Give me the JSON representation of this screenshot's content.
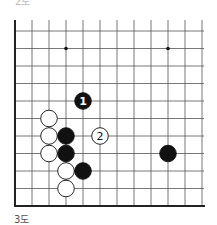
{
  "diagram": {
    "caption": "3도",
    "top_cut_caption": "2도",
    "board": {
      "columns": 12,
      "rows": 11,
      "origin_x": 15,
      "spacing_x": 17,
      "first_row_y": 31,
      "spacing_y": 17.5,
      "left_edge": true,
      "bottom_edge": true,
      "line_color": "#555555",
      "edge_color": "#222222",
      "star_points": [
        {
          "col": 3,
          "row": 1
        },
        {
          "col": 9,
          "row": 1
        }
      ]
    },
    "stones": [
      {
        "color": "black",
        "col": 4,
        "row": 4,
        "label": "1"
      },
      {
        "color": "white",
        "col": 2,
        "row": 5,
        "label": ""
      },
      {
        "color": "white",
        "col": 2,
        "row": 6,
        "label": ""
      },
      {
        "color": "black",
        "col": 3,
        "row": 6,
        "label": ""
      },
      {
        "color": "white",
        "col": 5,
        "row": 6,
        "label": "2"
      },
      {
        "color": "white",
        "col": 2,
        "row": 7,
        "label": ""
      },
      {
        "color": "black",
        "col": 3,
        "row": 7,
        "label": ""
      },
      {
        "color": "black",
        "col": 9,
        "row": 7,
        "label": ""
      },
      {
        "color": "white",
        "col": 3,
        "row": 8,
        "label": ""
      },
      {
        "color": "black",
        "col": 4,
        "row": 8,
        "label": ""
      },
      {
        "color": "white",
        "col": 3,
        "row": 9,
        "label": ""
      }
    ]
  }
}
